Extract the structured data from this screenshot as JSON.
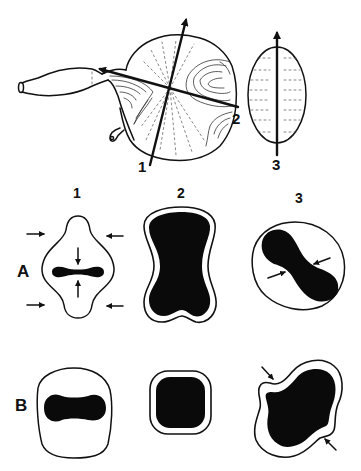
{
  "figure": {
    "top_view": {
      "axis_labels": [
        "1",
        "2",
        "3"
      ]
    },
    "column_labels": [
      "1",
      "2",
      "3"
    ],
    "row_labels": [
      "A",
      "B"
    ],
    "colors": {
      "ink": "#111111",
      "fill": "#0a0a0a",
      "background": "#ffffff"
    },
    "panels": [
      {
        "row": "A",
        "column": "1",
        "description": "rounded diamond outline with horizontal black slit, inward arrows"
      },
      {
        "row": "A",
        "column": "2",
        "description": "peanut-shaped black fill with thin white border"
      },
      {
        "row": "A",
        "column": "3",
        "description": "oval outline with diagonal S-shaped black fill, two inward arrows"
      },
      {
        "row": "B",
        "column": "1",
        "description": "rounded shield outline with black peanut fill"
      },
      {
        "row": "B",
        "column": "2",
        "description": "rounded square black fill with thin white border"
      },
      {
        "row": "B",
        "column": "3",
        "description": "irregular lobed black fill with white border, two inward arrows"
      }
    ]
  }
}
